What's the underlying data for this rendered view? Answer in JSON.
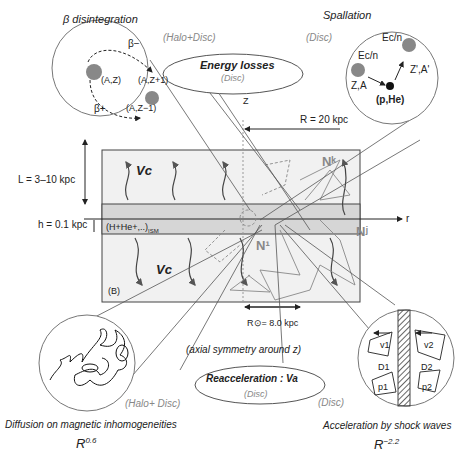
{
  "panels": {
    "beta": {
      "title": "β disintegration",
      "region": "(Halo+Disc)",
      "nodes": [
        "(A,Z)",
        "(A,Z+1)",
        "(A,Z−1)"
      ],
      "arrows": [
        "β−",
        "β+"
      ]
    },
    "spallation": {
      "title": "Spallation",
      "region": "(Disc)",
      "nodes": [
        "Z,A",
        "Z',A'",
        "(p,He)"
      ],
      "energy": [
        "Ec/n",
        "Ec/n"
      ]
    },
    "energy_losses": {
      "title": "Energy losses",
      "region": "(Disc)"
    },
    "reacceleration": {
      "title": "Reacceleration : Va",
      "region": "(Disc)"
    },
    "diffusion": {
      "title": "Diffusion on magnetic inhomogeneities",
      "region": "(Halo+ Disc)",
      "law_base": "R",
      "law_exp": "0.6"
    },
    "shock": {
      "title": "Acceleration by shock waves",
      "region": "(Disc)",
      "labels": [
        "v1",
        "v2",
        "D1",
        "D2",
        "p1",
        "p2"
      ],
      "law_base": "R",
      "law_exp": "−2.2"
    }
  },
  "galaxy": {
    "halo_height": "L = 3–10 kpc",
    "disc_height": "h = 0.1 kpc",
    "radius": "R = 20 kpc",
    "sun_radius": "R",
    "sun_radius_value": "= 8.0 kpc",
    "ism": "(H+He+,..)",
    "ism_sub": "ISM",
    "field": "(B)",
    "convection": [
      "Vc",
      "Vc"
    ],
    "axis_z": "Z",
    "axis_r": "r",
    "symmetry": "(axial symmetry around z)",
    "nuclei": [
      "N¹",
      "Nᵏ",
      "Nʲ"
    ]
  }
}
